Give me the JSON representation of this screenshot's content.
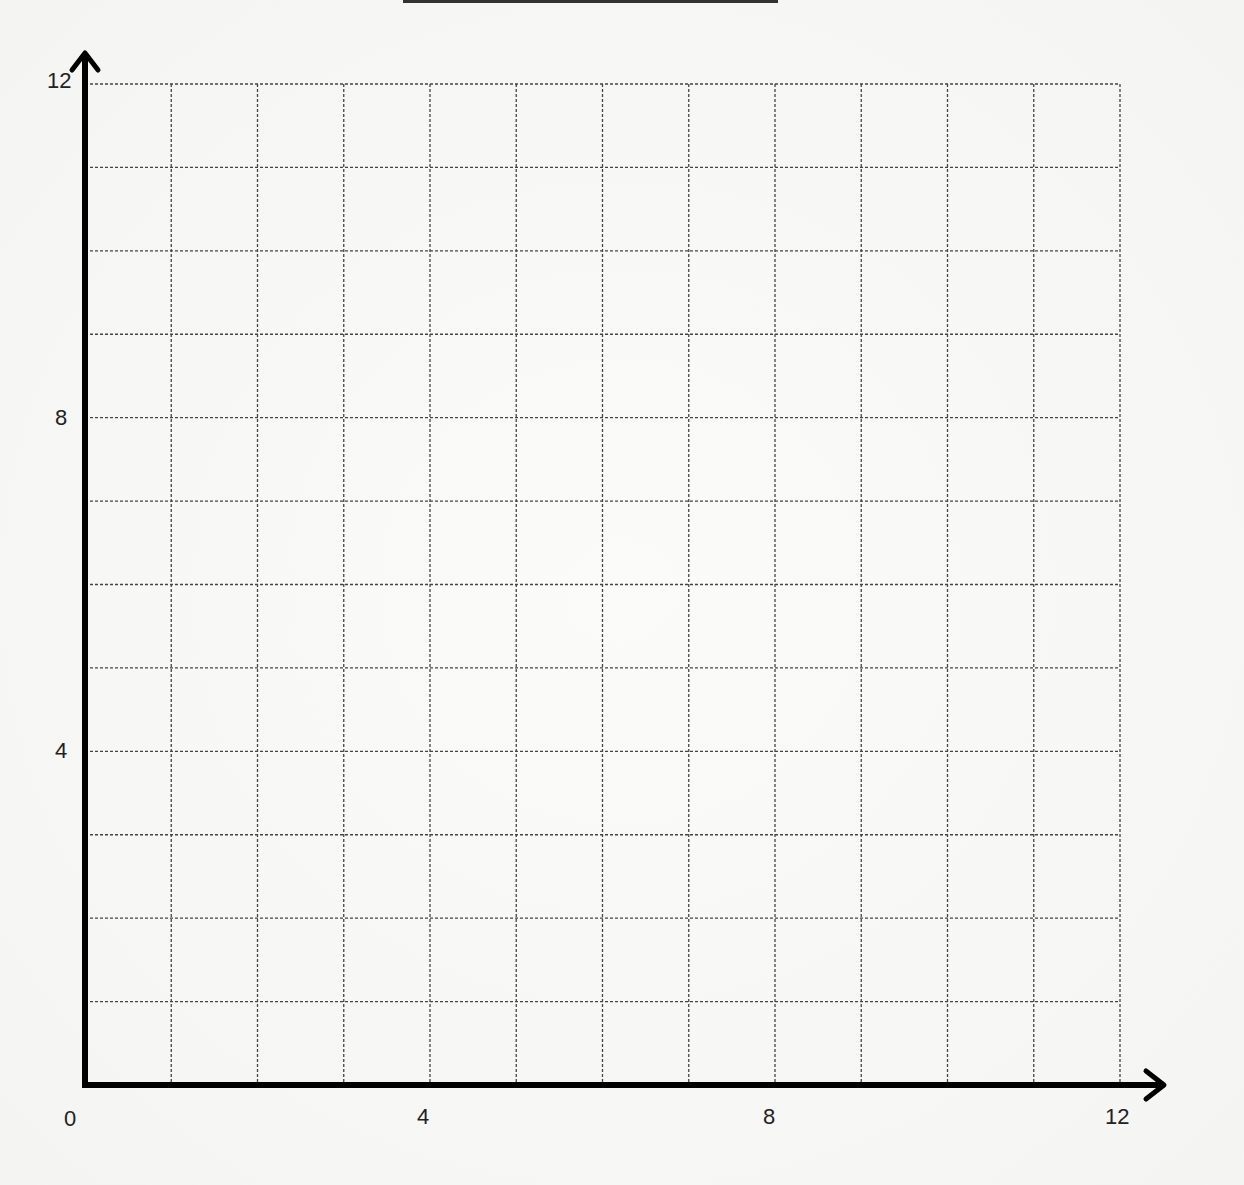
{
  "chart_data": {
    "type": "scatter",
    "title": "",
    "xlabel": "",
    "ylabel": "",
    "xlim": [
      0,
      12
    ],
    "ylim": [
      0,
      12
    ],
    "grid": true,
    "grid_style": "dashed",
    "grid_step": 1,
    "x_tick_labels": [
      "0",
      "4",
      "8",
      "12"
    ],
    "y_tick_labels": [
      "4",
      "8",
      "12"
    ],
    "series": [],
    "legend": null
  },
  "axes": {
    "origin_label": "0",
    "x_ticks": [
      {
        "value": 4,
        "label": "4"
      },
      {
        "value": 8,
        "label": "8"
      },
      {
        "value": 12,
        "label": "12"
      }
    ],
    "y_ticks": [
      {
        "value": 4,
        "label": "4"
      },
      {
        "value": 8,
        "label": "8"
      },
      {
        "value": 12,
        "label": "12"
      }
    ]
  },
  "colors": {
    "axis": "#000000",
    "grid": "#444444",
    "background": "#f7f7f5"
  }
}
